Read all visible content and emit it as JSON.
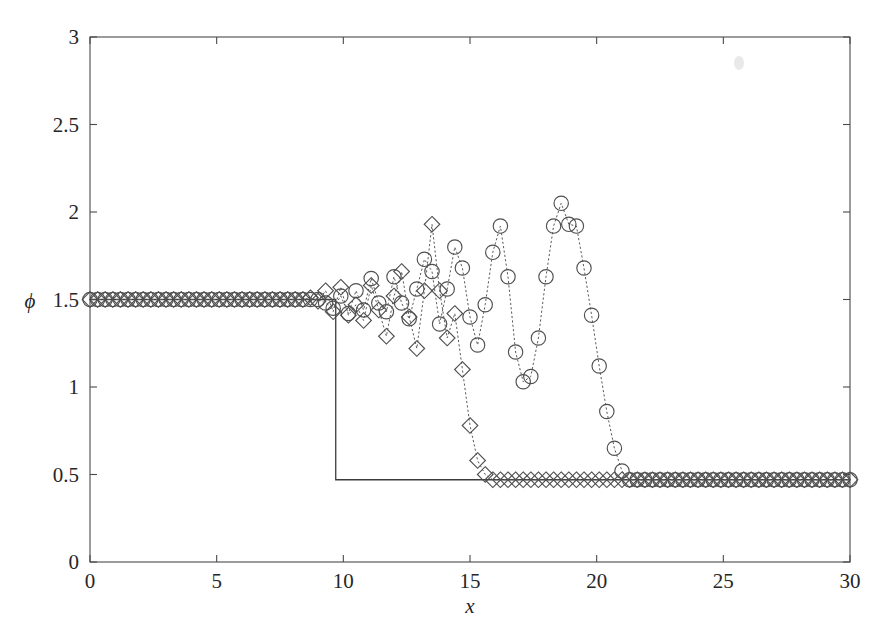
{
  "figure": {
    "background_color": "#ffffff",
    "axis_color": "#4a4a4a",
    "text_color": "#262626"
  },
  "chart_data": {
    "type": "line",
    "title": "",
    "subtitle": "",
    "xlabel": "x",
    "ylabel": "ϕ",
    "xlim": [
      0,
      30
    ],
    "ylim": [
      0,
      3
    ],
    "xticks": [
      0,
      5,
      10,
      15,
      20,
      25,
      30
    ],
    "xtick_labels": [
      "0",
      "5",
      "10",
      "15",
      "20",
      "25",
      "30"
    ],
    "yticks": [
      0,
      0.5,
      1,
      1.5,
      2,
      2.5,
      3
    ],
    "ytick_labels": [
      "0",
      "0.5",
      "1",
      "1.5",
      "2",
      "2.5",
      "3"
    ],
    "grid": false,
    "legend": null,
    "legend_position": "none",
    "tick_direction": "in",
    "box": true,
    "annotations": [],
    "series": [
      {
        "name": "exact-solution",
        "marker": "none",
        "linestyle": "solid",
        "color": "#3c3c3c",
        "x": [
          0,
          9.7,
          9.7,
          30
        ],
        "y": [
          1.5,
          1.5,
          0.47,
          0.47
        ]
      },
      {
        "name": "diamond-series",
        "marker": "diamond",
        "linestyle": "dotted",
        "color": "#4f4f4f",
        "x": [
          0.0,
          0.3,
          0.6,
          0.9,
          1.2,
          1.5,
          1.8,
          2.1,
          2.4,
          2.7,
          3.0,
          3.3,
          3.6,
          3.9,
          4.2,
          4.5,
          4.8,
          5.1,
          5.4,
          5.7,
          6.0,
          6.3,
          6.6,
          6.9,
          7.2,
          7.5,
          7.8,
          8.1,
          8.4,
          8.7,
          9.0,
          9.3,
          9.6,
          9.9,
          10.2,
          10.5,
          10.8,
          11.1,
          11.4,
          11.7,
          12.0,
          12.3,
          12.6,
          12.9,
          13.2,
          13.5,
          13.8,
          14.1,
          14.4,
          14.7,
          15.0,
          15.3,
          15.6,
          15.9,
          16.2,
          16.5,
          16.8,
          17.1,
          17.4,
          17.7,
          18.0,
          18.3,
          18.6,
          18.9,
          19.2,
          19.5,
          19.8,
          20.1,
          20.4,
          20.7,
          21.0,
          21.3,
          21.6,
          21.9,
          22.2,
          22.5,
          22.8,
          23.1,
          23.4,
          23.7,
          24.0,
          24.3,
          24.6,
          24.9,
          25.2,
          25.5,
          25.8,
          26.1,
          26.4,
          26.7,
          27.0,
          27.3,
          27.6,
          27.9,
          28.2,
          28.5,
          28.8,
          29.1,
          29.4,
          29.7,
          30.0
        ],
        "y": [
          1.5,
          1.5,
          1.5,
          1.5,
          1.5,
          1.5,
          1.5,
          1.5,
          1.5,
          1.5,
          1.5,
          1.5,
          1.5,
          1.5,
          1.5,
          1.5,
          1.5,
          1.5,
          1.5,
          1.5,
          1.5,
          1.5,
          1.5,
          1.5,
          1.5,
          1.5,
          1.5,
          1.5,
          1.5,
          1.51,
          1.49,
          1.55,
          1.43,
          1.57,
          1.41,
          1.47,
          1.38,
          1.58,
          1.44,
          1.29,
          1.52,
          1.66,
          1.4,
          1.22,
          1.55,
          1.93,
          1.55,
          1.28,
          1.42,
          1.1,
          0.78,
          0.58,
          0.5,
          0.47,
          0.47,
          0.47,
          0.47,
          0.47,
          0.47,
          0.47,
          0.47,
          0.47,
          0.47,
          0.47,
          0.47,
          0.47,
          0.47,
          0.47,
          0.47,
          0.47,
          0.47,
          0.47,
          0.47,
          0.47,
          0.47,
          0.47,
          0.47,
          0.47,
          0.47,
          0.47,
          0.47,
          0.47,
          0.47,
          0.47,
          0.47,
          0.47,
          0.47,
          0.47,
          0.47,
          0.47,
          0.47,
          0.47,
          0.47,
          0.47,
          0.47,
          0.47,
          0.47,
          0.47,
          0.47,
          0.47,
          0.47
        ]
      },
      {
        "name": "circle-series",
        "marker": "circle",
        "linestyle": "dotted",
        "color": "#4f4f4f",
        "x": [
          0.0,
          0.3,
          0.6,
          0.9,
          1.2,
          1.5,
          1.8,
          2.1,
          2.4,
          2.7,
          3.0,
          3.3,
          3.6,
          3.9,
          4.2,
          4.5,
          4.8,
          5.1,
          5.4,
          5.7,
          6.0,
          6.3,
          6.6,
          6.9,
          7.2,
          7.5,
          7.8,
          8.1,
          8.4,
          8.7,
          9.0,
          9.3,
          9.6,
          9.9,
          10.2,
          10.5,
          10.8,
          11.1,
          11.4,
          11.7,
          12.0,
          12.3,
          12.6,
          12.9,
          13.2,
          13.5,
          13.8,
          14.1,
          14.4,
          14.7,
          15.0,
          15.3,
          15.6,
          15.9,
          16.2,
          16.5,
          16.8,
          17.1,
          17.4,
          17.7,
          18.0,
          18.3,
          18.6,
          18.9,
          19.2,
          19.5,
          19.8,
          20.1,
          20.4,
          20.7,
          21.0,
          21.3,
          21.6,
          21.9,
          22.2,
          22.5,
          22.8,
          23.1,
          23.4,
          23.7,
          24.0,
          24.3,
          24.6,
          24.9,
          25.2,
          25.5,
          25.8,
          26.1,
          26.4,
          26.7,
          27.0,
          27.3,
          27.6,
          27.9,
          28.2,
          28.5,
          28.8,
          29.1,
          29.4,
          29.7,
          30.0
        ],
        "y": [
          1.5,
          1.5,
          1.5,
          1.5,
          1.5,
          1.5,
          1.5,
          1.5,
          1.5,
          1.5,
          1.5,
          1.5,
          1.5,
          1.5,
          1.5,
          1.5,
          1.5,
          1.5,
          1.5,
          1.5,
          1.5,
          1.5,
          1.5,
          1.5,
          1.5,
          1.5,
          1.5,
          1.5,
          1.5,
          1.5,
          1.5,
          1.48,
          1.45,
          1.52,
          1.42,
          1.55,
          1.44,
          1.62,
          1.48,
          1.43,
          1.63,
          1.48,
          1.39,
          1.56,
          1.73,
          1.66,
          1.36,
          1.56,
          1.8,
          1.68,
          1.4,
          1.24,
          1.47,
          1.77,
          1.92,
          1.63,
          1.2,
          1.03,
          1.06,
          1.28,
          1.63,
          1.92,
          2.05,
          1.93,
          1.92,
          1.68,
          1.41,
          1.12,
          0.86,
          0.65,
          0.52,
          0.47,
          0.47,
          0.47,
          0.47,
          0.47,
          0.47,
          0.47,
          0.47,
          0.47,
          0.47,
          0.47,
          0.47,
          0.47,
          0.47,
          0.47,
          0.47,
          0.47,
          0.47,
          0.47,
          0.47,
          0.47,
          0.47,
          0.47,
          0.47,
          0.47,
          0.47,
          0.47,
          0.47,
          0.47,
          0.47
        ]
      }
    ]
  }
}
